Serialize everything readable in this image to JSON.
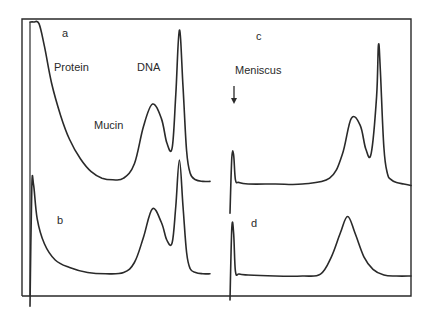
{
  "chart_data": {
    "type": "line",
    "title": "",
    "xlabel": "",
    "ylabel": "",
    "grid": false,
    "panels": [
      {
        "id": "a",
        "label": "a",
        "annotations": [
          "Protein",
          "DNA",
          "Mucin"
        ],
        "series": [
          {
            "name": "trace-a",
            "x": [
              0.0,
              0.02,
              0.05,
              0.08,
              0.12,
              0.17,
              0.22,
              0.28,
              0.34,
              0.4,
              0.46,
              0.52,
              0.58,
              0.63,
              0.68,
              0.73,
              0.76,
              0.79,
              0.81,
              0.83,
              0.85,
              0.87,
              0.89,
              0.92,
              0.96,
              1.0
            ],
            "y": [
              1.0,
              1.0,
              0.99,
              0.85,
              0.62,
              0.42,
              0.27,
              0.15,
              0.07,
              0.03,
              0.02,
              0.03,
              0.12,
              0.35,
              0.49,
              0.4,
              0.25,
              0.22,
              0.55,
              0.95,
              0.6,
              0.2,
              0.06,
              0.02,
              0.01,
              0.01
            ]
          }
        ]
      },
      {
        "id": "b",
        "label": "b",
        "annotations": [],
        "series": [
          {
            "name": "trace-b",
            "x": [
              0.0,
              0.01,
              0.02,
              0.04,
              0.08,
              0.14,
              0.22,
              0.32,
              0.42,
              0.52,
              0.58,
              0.63,
              0.68,
              0.73,
              0.76,
              0.79,
              0.81,
              0.83,
              0.85,
              0.87,
              0.89,
              0.92,
              0.96,
              1.0
            ],
            "y": [
              -0.25,
              0.7,
              0.72,
              0.45,
              0.25,
              0.12,
              0.06,
              0.02,
              0.01,
              0.02,
              0.1,
              0.3,
              0.53,
              0.42,
              0.28,
              0.26,
              0.55,
              0.92,
              0.55,
              0.18,
              0.05,
              0.02,
              0.01,
              0.01
            ]
          }
        ]
      },
      {
        "id": "c",
        "label": "c",
        "annotations": [
          "Meniscus"
        ],
        "series": [
          {
            "name": "trace-c",
            "x": [
              0.0,
              0.01,
              0.02,
              0.03,
              0.05,
              0.1,
              0.25,
              0.4,
              0.55,
              0.62,
              0.67,
              0.72,
              0.75,
              0.78,
              0.81,
              0.82,
              0.83,
              0.85,
              0.87,
              0.89,
              0.92,
              0.96,
              1.0
            ],
            "y": [
              -0.2,
              0.18,
              0.2,
              0.03,
              0.01,
              0.0,
              0.0,
              0.0,
              0.04,
              0.2,
              0.45,
              0.4,
              0.24,
              0.21,
              0.6,
              0.95,
              0.8,
              0.25,
              0.07,
              0.03,
              0.01,
              0.0,
              -0.01
            ]
          }
        ]
      },
      {
        "id": "d",
        "label": "d",
        "annotations": [],
        "series": [
          {
            "name": "trace-d",
            "x": [
              0.0,
              0.01,
              0.02,
              0.03,
              0.05,
              0.1,
              0.25,
              0.4,
              0.5,
              0.56,
              0.61,
              0.65,
              0.69,
              0.74,
              0.79,
              0.85,
              0.92,
              1.0
            ],
            "y": [
              -0.25,
              0.5,
              0.45,
              0.05,
              0.02,
              0.01,
              0.0,
              0.0,
              0.02,
              0.2,
              0.45,
              0.62,
              0.45,
              0.2,
              0.07,
              0.01,
              0.0,
              0.0
            ]
          }
        ]
      }
    ],
    "legend": "none"
  },
  "labels": {
    "a": "a",
    "b": "b",
    "c": "c",
    "d": "d",
    "protein": "Protein",
    "dna": "DNA",
    "mucin": "Mucin",
    "meniscus": "Meniscus"
  }
}
